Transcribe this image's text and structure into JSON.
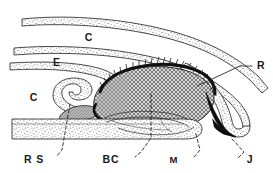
{
  "figure": {
    "background_color": "#ffffff",
    "ink_color": "#1d1d1d",
    "width": 273,
    "height": 173
  },
  "labels": [
    {
      "id": "label-c-upper",
      "text": "C",
      "name": "label-c-upper",
      "x": 89,
      "y": 41,
      "leader": "none",
      "description": "upper conjunctiva space label"
    },
    {
      "id": "label-e",
      "text": "E",
      "name": "label-e",
      "x": 57,
      "y": 66,
      "leader": "none",
      "description": "eyelid label"
    },
    {
      "id": "label-c-lower",
      "text": "C",
      "name": "label-c-lower",
      "x": 34,
      "y": 101,
      "leader": "none",
      "description": "lower conjunctiva space label"
    },
    {
      "id": "label-r",
      "text": "R",
      "name": "label-r",
      "x": 257,
      "y": 69,
      "leader": "straight",
      "description": "retina / posterior wall label with straight leader"
    },
    {
      "id": "label-rs",
      "text": "R S",
      "name": "label-rs",
      "x": 34,
      "y": 163,
      "leader": "dashed",
      "description": "retractor sheath label with dashed leader"
    },
    {
      "id": "label-bc",
      "text": "BC",
      "name": "label-bc",
      "x": 111,
      "y": 163,
      "leader": "dashed",
      "description": "basal cell mass label with dashed leader"
    },
    {
      "id": "label-m",
      "text": "M",
      "name": "label-m",
      "x": 174,
      "y": 163,
      "leader": "dashed",
      "description": "muscle label with dashed leader"
    },
    {
      "id": "label-j",
      "text": "J",
      "name": "label-j",
      "x": 246,
      "y": 163,
      "leader": "dashed",
      "description": "junction label with dashed leader"
    }
  ],
  "structures": [
    {
      "id": "band-top",
      "name": "stippled-band-top",
      "texture": "stipple",
      "description": "uppermost stippled band sweeping right and down"
    },
    {
      "id": "band-middle",
      "name": "stippled-band-middle",
      "texture": "stipple",
      "description": "middle stippled band (eyelid E) sweeping right and down"
    },
    {
      "id": "band-fornix",
      "name": "stippled-band-fornix",
      "texture": "stipple",
      "description": "stippled band curling back on itself forming hook / fornix"
    },
    {
      "id": "band-bottom",
      "name": "stippled-band-bottom",
      "texture": "stipple",
      "description": "lower horizontal stippled band with rounded right end"
    },
    {
      "id": "mass-central",
      "name": "hatched-mass",
      "texture": "cross-hatch",
      "description": "central teardrop / comma shaped cross-hatched mass with dark bristled upper margin"
    },
    {
      "id": "wedge-j",
      "name": "black-wedge",
      "texture": "solid-black",
      "description": "solid black wedge at lower right junction"
    },
    {
      "id": "muscle-strand",
      "name": "muscle-strand",
      "texture": "line",
      "description": "thin muscle strand running into lower band"
    }
  ]
}
